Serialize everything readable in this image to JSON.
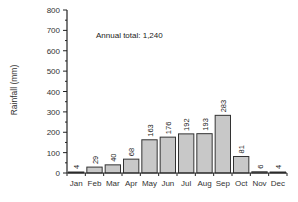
{
  "chart_data": {
    "type": "bar",
    "title": "",
    "xlabel": "",
    "ylabel": "Rainfall (mm)",
    "ylim": [
      0,
      800
    ],
    "yticks": [
      0,
      100,
      200,
      300,
      400,
      500,
      600,
      700,
      800
    ],
    "categories": [
      "Jan",
      "Feb",
      "Mar",
      "Apr",
      "May",
      "Jun",
      "Jul",
      "Aug",
      "Sep",
      "Oct",
      "Nov",
      "Dec"
    ],
    "values": [
      4,
      29,
      40,
      68,
      163,
      176,
      192,
      193,
      283,
      81,
      6,
      4
    ],
    "value_labels": [
      "4",
      "29",
      "40",
      "68",
      "163",
      "176",
      "192",
      "193",
      "283",
      "81",
      "6",
      "4"
    ],
    "annotation": "Annual total:  1,240",
    "grid": false,
    "legend": null,
    "bar_color": "#c8c8c8",
    "bar_edge_color": "#333333"
  }
}
